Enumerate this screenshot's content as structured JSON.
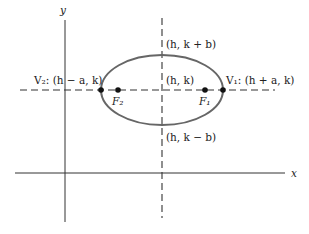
{
  "diagram": {
    "type": "ellipse-horizontal-major-axis",
    "axes": {
      "x_label": "x",
      "y_label": "y"
    },
    "points": {
      "center": "(h, k)",
      "top": "(h, k + b)",
      "bottom": "(h, k − b)",
      "v1": "V₁: (h + a, k)",
      "v2": "V₂: (h − a, k)",
      "f1": "F₁",
      "f2": "F₂"
    },
    "colors": {
      "ellipse": "#666666",
      "axes": "#333333",
      "dashed": "#333333",
      "points": "#111111"
    }
  }
}
